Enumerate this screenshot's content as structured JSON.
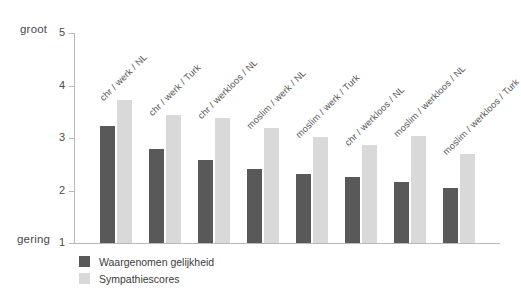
{
  "chart_data": {
    "type": "bar",
    "title": "",
    "subtitle": "",
    "xlabel": "",
    "ylabel": "",
    "ylim": [
      1,
      5
    ],
    "y_ticks": [
      "5",
      "4",
      "3",
      "2",
      "1"
    ],
    "y_axis_top_anchor": "groot",
    "y_axis_bottom_anchor": "gering",
    "grid": false,
    "legend_position": "bottom-left",
    "categories": [
      "chr / werk / NL",
      "chr / werk / Turk",
      "chr / werkloos / NL",
      "moslim / werk / NL",
      "moslim / werk / Turk",
      "chr / werkloos / NL",
      "moslim / werkloos / NL",
      "moslim / werkloos / Turk"
    ],
    "series": [
      {
        "name": "Waargenomen gelijkheid",
        "color": "#595959",
        "values": [
          3.22,
          2.8,
          2.59,
          2.41,
          2.32,
          2.25,
          2.16,
          2.04
        ]
      },
      {
        "name": "Sympathiescores",
        "color": "#d9d9d9",
        "values": [
          3.72,
          3.43,
          3.38,
          3.2,
          3.02,
          2.87,
          3.03,
          2.69
        ]
      }
    ]
  },
  "axis": {
    "top_anchor": "groot",
    "bottom_anchor": "gering"
  }
}
